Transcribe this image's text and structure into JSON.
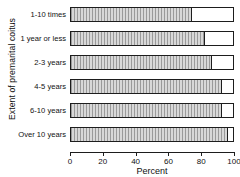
{
  "chart_data": {
    "type": "bar",
    "orientation": "horizontal",
    "title": "",
    "xlabel": "Percent",
    "ylabel": "Extent of premarital coitus",
    "categories": [
      "1-10 times",
      "1 year or less",
      "2-3 years",
      "4-5 years",
      "6-10 years",
      "Over 10 years"
    ],
    "values": [
      74,
      82,
      86,
      92,
      92,
      96
    ],
    "xlim": [
      0,
      100
    ],
    "xticks": [
      0,
      20,
      40,
      60,
      80,
      100
    ],
    "xtick_labels": [
      "0",
      "20",
      "40",
      "60",
      "80",
      "100"
    ],
    "grid": false,
    "legend": false,
    "bar_fill_color": "#c9c9c9",
    "bar_hatch": "vertical-lines",
    "bar_edge_color": "#1d1d1d",
    "background_color": "#ffffff",
    "note": "Each row is drawn as a full-width outlined box spanning 0-100%, with the shaded hatched portion representing the value."
  }
}
